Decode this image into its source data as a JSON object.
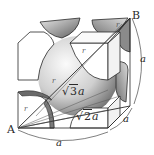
{
  "diagram": {
    "type": "body-centered cubic unit cell with atom sections",
    "points": {
      "A": "A",
      "B": "B"
    },
    "labels": {
      "body_diagonal": {
        "root": "√",
        "radicand": "3",
        "var": "a"
      },
      "face_diagonal": {
        "root": "√",
        "radicand": "2",
        "var": "a"
      },
      "edge_bottom": "a",
      "edge_right": "a",
      "edge_depth": "a",
      "radius": [
        "r",
        "r",
        "r",
        "r"
      ]
    },
    "colors": {
      "line": "#2a2a2a",
      "sphere_light": "#f4f4f4",
      "sphere_dark": "#6e6e6e",
      "background": "#ffffff"
    }
  }
}
